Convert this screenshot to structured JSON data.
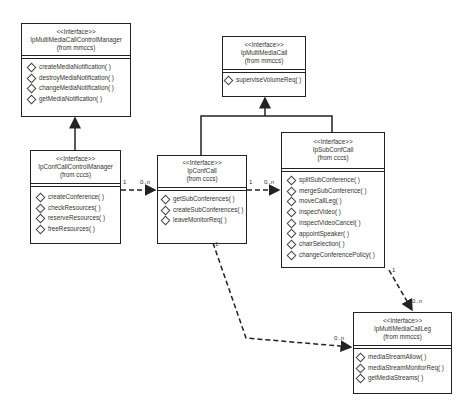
{
  "classes": {
    "mmccm": {
      "stereotype": "<<Interface>>",
      "name": "IpMultiMediaCallControlManager",
      "package": "(from mmccs)",
      "operations": [
        "createMediaNotification( )",
        "destroyMediaNotification( )",
        "changeMediaNotification( )",
        "getMediaNotification( )"
      ]
    },
    "confccm": {
      "stereotype": "<<Interface>>",
      "name": "IpConfCallControlManager",
      "package": "(from cccs)",
      "operations": [
        "createConference( )",
        "checkResources( )",
        "reserveResources( )",
        "freeResources( )"
      ]
    },
    "mmcall": {
      "stereotype": "<<Interface>>",
      "name": "IpMultiMediaCall",
      "package": "(from mmccs)",
      "operations": [
        "superviseVolumeReq( )"
      ]
    },
    "confcall": {
      "stereotype": "<<Interface>>",
      "name": "IpConfCall",
      "package": "(from cccs)",
      "operations": [
        "getSubConferences( )",
        "createSubConferences( )",
        "leaveMonitorReq( )"
      ]
    },
    "subconf": {
      "stereotype": "<<Interface>>",
      "name": "IpSubConfCall",
      "package": "(from cccs)",
      "operations": [
        "splitSubConference( )",
        "mergeSubConference( )",
        "moveCallLeg( )",
        "inspectVideo( )",
        "inspectVideoCancel( )",
        "appointSpeaker( )",
        "chairSelection( )",
        "changeConferencePolicy( )"
      ]
    },
    "callleg": {
      "stereotype": "<<Interface>>",
      "name": "IpMultiMediaCallLeg",
      "package": "(from mmccs)",
      "operations": [
        "mediaStreamAllow( )",
        "mediaStreamMonitorReq( )",
        "getMediaStreams( )"
      ]
    }
  },
  "multiplicities": {
    "ccm_to_conf_src": "1",
    "ccm_to_conf_dst": "0..n",
    "conf_to_sub_src": "1",
    "conf_to_sub_dst": "0..n",
    "conf_to_leg_src": "1",
    "conf_to_leg_dst": "0..n",
    "sub_to_leg_src": "1",
    "sub_to_leg_dst": "0..n"
  }
}
